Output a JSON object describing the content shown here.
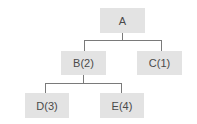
{
  "diagram": {
    "type": "tree",
    "nodes": [
      {
        "id": "A",
        "label": "A"
      },
      {
        "id": "B",
        "label": "B(2)"
      },
      {
        "id": "C",
        "label": "C(1)"
      },
      {
        "id": "D",
        "label": "D(3)"
      },
      {
        "id": "E",
        "label": "E(4)"
      }
    ],
    "edges": [
      {
        "from": "A",
        "to": "B"
      },
      {
        "from": "A",
        "to": "C"
      },
      {
        "from": "B",
        "to": "D"
      },
      {
        "from": "B",
        "to": "E"
      }
    ],
    "colors": {
      "node_fill": "#e3e3e3",
      "line": "#7a7a7a",
      "text": "#4a4a4a"
    }
  }
}
